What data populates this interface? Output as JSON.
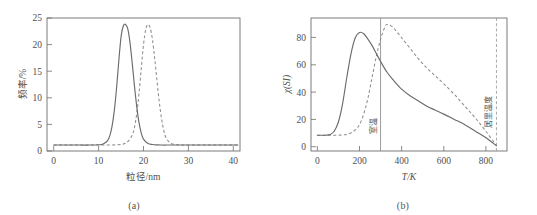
{
  "figure": {
    "panel_a_caption": "(a)",
    "panel_b_caption": "(b)"
  },
  "chart_data": [
    {
      "id": "panel-a",
      "type": "line",
      "title": "",
      "xlabel": "粒径/nm",
      "ylabel": "频率/%",
      "xlim": [
        -1.5,
        41.5
      ],
      "ylim": [
        -1.2,
        25.6
      ],
      "xticks": [
        0,
        10,
        20,
        30,
        40
      ],
      "yticks": [
        0,
        5,
        10,
        15,
        20,
        25
      ],
      "grid": false,
      "legend": "none",
      "series": [
        {
          "name": "solid",
          "style": "solid",
          "peak_x": 16,
          "peak_y": 24.3,
          "sigma": 1.75,
          "x": [
            0,
            2,
            4,
            6,
            8,
            10,
            11,
            12,
            12.5,
            13,
            13.5,
            14,
            14.5,
            15,
            15.5,
            16,
            16.5,
            17,
            17.5,
            18,
            18.5,
            19,
            19.5,
            20,
            21,
            22,
            23,
            24,
            26,
            28,
            30,
            34,
            38,
            41
          ],
          "y": [
            0,
            0,
            0,
            0,
            0,
            0.05,
            0.2,
            0.9,
            1.9,
            3.8,
            7.0,
            11.5,
            17.0,
            21.8,
            24.0,
            24.3,
            23.4,
            20.6,
            16.4,
            11.8,
            7.7,
            4.5,
            2.4,
            1.2,
            0.3,
            0.1,
            0.03,
            0,
            0,
            0,
            0,
            0,
            0,
            0
          ]
        },
        {
          "name": "dashed",
          "style": "dashed",
          "peak_x": 21,
          "peak_y": 24.3,
          "sigma": 1.85,
          "x": [
            0,
            2,
            4,
            6,
            8,
            10,
            12,
            14,
            15.5,
            16.5,
            17.5,
            18,
            18.5,
            19,
            19.5,
            20,
            20.5,
            21,
            21.5,
            22,
            22.5,
            23,
            23.5,
            24,
            24.5,
            25,
            26,
            27,
            28,
            30,
            34,
            38,
            41
          ],
          "y": [
            0,
            0,
            0,
            0,
            0,
            0,
            0,
            0.05,
            0.2,
            0.7,
            2.0,
            3.6,
            6.4,
            10.4,
            15.4,
            20.2,
            23.3,
            24.3,
            23.6,
            21.2,
            17.4,
            13.0,
            8.8,
            5.4,
            3.0,
            1.5,
            0.4,
            0.12,
            0.04,
            0,
            0,
            0,
            0
          ]
        }
      ]
    },
    {
      "id": "panel-b",
      "type": "line",
      "title": "",
      "xlabel": "T/K",
      "ylabel": "χ(SI)",
      "xlim": [
        -30,
        900
      ],
      "ylim": [
        -4,
        97
      ],
      "xticks": [
        0,
        200,
        400,
        600,
        800
      ],
      "yticks": [
        0,
        20,
        40,
        60,
        80
      ],
      "grid": false,
      "legend": "none",
      "annotations": [
        {
          "name": "room-temperature",
          "label": "室温",
          "x": 300,
          "style": "solid"
        },
        {
          "name": "curie-temperature",
          "label": "居里温度",
          "x": 850,
          "style": "dashed"
        }
      ],
      "series": [
        {
          "name": "solid",
          "style": "solid",
          "peak_x": 200,
          "peak_y": 86,
          "baseline": 8,
          "x": [
            0,
            20,
            40,
            60,
            80,
            100,
            120,
            140,
            160,
            180,
            200,
            220,
            240,
            260,
            280,
            300,
            330,
            360,
            400,
            440,
            480,
            520,
            560,
            600,
            650,
            700,
            750,
            800,
            850
          ],
          "y": [
            8,
            8,
            8,
            8.5,
            11,
            18,
            32,
            52,
            70,
            82,
            86,
            85,
            81,
            76,
            70,
            64,
            56,
            50,
            43,
            38,
            34,
            30,
            27,
            24,
            20,
            16,
            11,
            6,
            0
          ]
        },
        {
          "name": "dashed",
          "style": "dashed",
          "peak_x": 330,
          "peak_y": 92,
          "baseline": 8,
          "x": [
            0,
            40,
            80,
            120,
            150,
            180,
            200,
            220,
            240,
            260,
            280,
            300,
            320,
            330,
            350,
            370,
            400,
            440,
            480,
            520,
            560,
            600,
            650,
            700,
            750,
            800,
            850
          ],
          "y": [
            8,
            8,
            8,
            8.2,
            9,
            12,
            16,
            24,
            36,
            52,
            68,
            81,
            90,
            92,
            91,
            88,
            82,
            74,
            66,
            59,
            53,
            47,
            39,
            30,
            21,
            11,
            0
          ]
        }
      ]
    }
  ]
}
